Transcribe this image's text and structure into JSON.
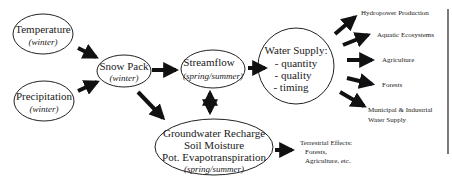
{
  "diagram": {
    "nodes": {
      "temperature": {
        "title": "Temperature",
        "sub": "(winter)"
      },
      "precipitation": {
        "title": "Precipitation",
        "sub": "(winter)"
      },
      "snowpack": {
        "title": "Snow Pack",
        "sub": "(winter)"
      },
      "streamflow": {
        "title": "Streamflow",
        "sub": "(spring/summer)"
      },
      "groundwater": {
        "line1": "Groundwater Recharge",
        "line2": "Soil Moisture",
        "line3": "Pot. Evapotranspiration",
        "sub": "(spring/summer)"
      },
      "watersupply": {
        "title": "Water Supply:",
        "items": [
          "- quantity",
          "- quality",
          "- timing"
        ]
      }
    },
    "outputs": [
      "Hydropower Production",
      "Aquatic Ecosystems",
      "Agriculture",
      "Forests",
      "Municipal & Industrial",
      "Water Supply"
    ],
    "terrestrial": [
      "Terrestrial Effects:",
      "Forests,",
      "Agriculture, etc."
    ]
  }
}
